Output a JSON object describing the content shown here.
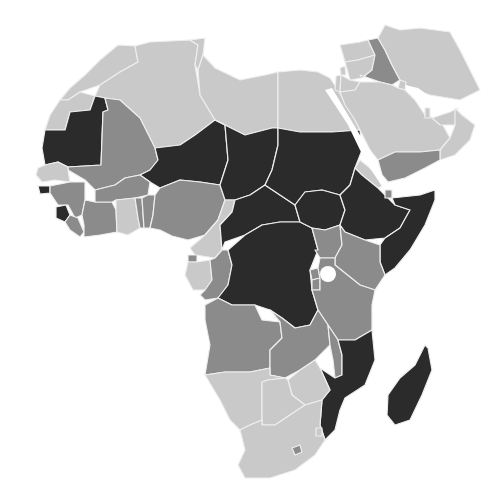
{
  "map": {
    "type": "choropleth",
    "region": "Africa and Middle East",
    "legend_shown": false,
    "colors": {
      "light": "#c9c9c9",
      "medium": "#8b8b8b",
      "dark": "#2b2b2b",
      "border": "#eeeeee",
      "background": "#ffffff"
    },
    "countries": [
      {
        "id": "morocco",
        "level": "light"
      },
      {
        "id": "algeria",
        "level": "light"
      },
      {
        "id": "tunisia",
        "level": "light"
      },
      {
        "id": "libya",
        "level": "light"
      },
      {
        "id": "egypt",
        "level": "light"
      },
      {
        "id": "western-sahara",
        "level": "light"
      },
      {
        "id": "mauritania",
        "level": "dark"
      },
      {
        "id": "mali",
        "level": "medium"
      },
      {
        "id": "niger",
        "level": "dark"
      },
      {
        "id": "chad",
        "level": "dark"
      },
      {
        "id": "sudan",
        "level": "dark"
      },
      {
        "id": "south-sudan",
        "level": "dark"
      },
      {
        "id": "eritrea",
        "level": "light"
      },
      {
        "id": "ethiopia",
        "level": "dark"
      },
      {
        "id": "djibouti",
        "level": "medium"
      },
      {
        "id": "somalia",
        "level": "dark"
      },
      {
        "id": "senegal",
        "level": "light"
      },
      {
        "id": "gambia",
        "level": "light"
      },
      {
        "id": "guinea-bissau",
        "level": "dark"
      },
      {
        "id": "guinea",
        "level": "medium"
      },
      {
        "id": "sierra-leone",
        "level": "dark"
      },
      {
        "id": "liberia",
        "level": "medium"
      },
      {
        "id": "ivory-coast",
        "level": "medium"
      },
      {
        "id": "burkina-faso",
        "level": "medium"
      },
      {
        "id": "ghana",
        "level": "light"
      },
      {
        "id": "togo",
        "level": "medium"
      },
      {
        "id": "benin",
        "level": "medium"
      },
      {
        "id": "nigeria",
        "level": "medium"
      },
      {
        "id": "cameroon",
        "level": "light"
      },
      {
        "id": "central-african-republic",
        "level": "dark"
      },
      {
        "id": "equatorial-guinea",
        "level": "medium"
      },
      {
        "id": "gabon",
        "level": "light"
      },
      {
        "id": "congo",
        "level": "medium"
      },
      {
        "id": "dr-congo",
        "level": "dark"
      },
      {
        "id": "uganda",
        "level": "medium"
      },
      {
        "id": "kenya",
        "level": "medium"
      },
      {
        "id": "rwanda",
        "level": "medium"
      },
      {
        "id": "burundi",
        "level": "medium"
      },
      {
        "id": "tanzania",
        "level": "medium"
      },
      {
        "id": "angola",
        "level": "medium"
      },
      {
        "id": "zambia",
        "level": "medium"
      },
      {
        "id": "malawi",
        "level": "medium"
      },
      {
        "id": "mozambique",
        "level": "dark"
      },
      {
        "id": "zimbabwe",
        "level": "light"
      },
      {
        "id": "namibia",
        "level": "light"
      },
      {
        "id": "botswana",
        "level": "light"
      },
      {
        "id": "south-africa",
        "level": "light"
      },
      {
        "id": "lesotho",
        "level": "medium"
      },
      {
        "id": "swaziland",
        "level": "light"
      },
      {
        "id": "madagascar",
        "level": "dark"
      },
      {
        "id": "turkey-south",
        "level": "light"
      },
      {
        "id": "syria",
        "level": "light"
      },
      {
        "id": "lebanon",
        "level": "light"
      },
      {
        "id": "israel",
        "level": "light"
      },
      {
        "id": "jordan",
        "level": "light"
      },
      {
        "id": "iraq",
        "level": "medium"
      },
      {
        "id": "iran",
        "level": "light"
      },
      {
        "id": "saudi-arabia",
        "level": "light"
      },
      {
        "id": "kuwait",
        "level": "light"
      },
      {
        "id": "qatar",
        "level": "light"
      },
      {
        "id": "uae",
        "level": "light"
      },
      {
        "id": "oman",
        "level": "light"
      },
      {
        "id": "yemen",
        "level": "medium"
      }
    ]
  }
}
